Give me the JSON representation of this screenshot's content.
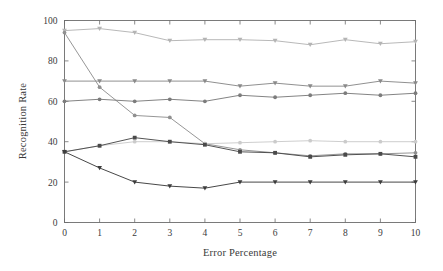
{
  "chart_data": {
    "type": "line",
    "title": "",
    "xlabel": "Error Percentage",
    "ylabel": "Recognition Rate",
    "x": [
      0,
      1,
      2,
      3,
      4,
      5,
      6,
      7,
      8,
      9,
      10
    ],
    "xlim": [
      0,
      10
    ],
    "ylim": [
      0,
      100
    ],
    "xticks": [
      "0",
      "1",
      "2",
      "3",
      "4",
      "5",
      "6",
      "7",
      "8",
      "9",
      "10"
    ],
    "yticks": [
      "0",
      "20",
      "40",
      "60",
      "80",
      "100"
    ],
    "grid": false,
    "legend": "none",
    "series": [
      {
        "name": "series-1-top",
        "color": "#b4b4b4",
        "marker": "triangle-down",
        "values": [
          95,
          96,
          94,
          90,
          90.5,
          90.5,
          90,
          88,
          90.5,
          88.5,
          89.5
        ]
      },
      {
        "name": "series-2-steep-decline",
        "color": "#909090",
        "marker": "circle",
        "values": [
          94,
          67,
          53,
          52,
          39,
          36,
          34.5,
          33,
          34,
          34,
          34.5
        ]
      },
      {
        "name": "series-3-upper-mid",
        "color": "#8a8a8a",
        "marker": "triangle-down",
        "values": [
          70,
          70,
          70,
          70,
          70,
          67.5,
          69,
          67.5,
          67.5,
          70,
          69
        ]
      },
      {
        "name": "series-4-lower-mid",
        "color": "#7c7c7c",
        "marker": "circle",
        "values": [
          60,
          61,
          60,
          61,
          60,
          63,
          62,
          63,
          64,
          63,
          64
        ]
      },
      {
        "name": "series-5-light-flat",
        "color": "#cbcbcb",
        "marker": "circle",
        "values": [
          35,
          38,
          40,
          40,
          39,
          39.5,
          40,
          40.5,
          40,
          40,
          40
        ]
      },
      {
        "name": "series-6-peak-then-flat",
        "color": "#4a4a4a",
        "marker": "square",
        "values": [
          35,
          38,
          42,
          40,
          38.5,
          35,
          34.5,
          32.5,
          33.5,
          34,
          32.5
        ]
      },
      {
        "name": "series-7-bottom",
        "color": "#3d3d3d",
        "marker": "triangle-down",
        "values": [
          35,
          27,
          20,
          18,
          17,
          20,
          20,
          20,
          20,
          20,
          20
        ]
      }
    ]
  },
  "axes": {
    "x_title": "Error Percentage",
    "y_title": "Recognition Rate"
  }
}
